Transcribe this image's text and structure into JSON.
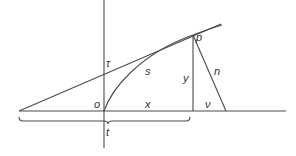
{
  "diagram": {
    "title": "",
    "colors": {
      "stroke": "#4a4a4a",
      "label": "#333333",
      "background": "#ffffff"
    },
    "labels": {
      "tau": "τ",
      "s": "s",
      "p": "p",
      "y": "y",
      "n": "n",
      "o": "o",
      "x": "x",
      "nu": "ν",
      "t": "t"
    },
    "elements": [
      {
        "id": "y-axis",
        "type": "line",
        "desc": "vertical axis"
      },
      {
        "id": "x-axis",
        "type": "line",
        "desc": "horizontal baseline"
      },
      {
        "id": "tangent",
        "type": "line",
        "desc": "tangent at p"
      },
      {
        "id": "curve",
        "type": "curve",
        "desc": "arc s from o to p"
      },
      {
        "id": "ordinate",
        "type": "line",
        "desc": "vertical from p (y)"
      },
      {
        "id": "normal",
        "type": "line",
        "desc": "normal from p (n)"
      },
      {
        "id": "brace",
        "type": "brace",
        "desc": "subtangent span t"
      }
    ]
  }
}
